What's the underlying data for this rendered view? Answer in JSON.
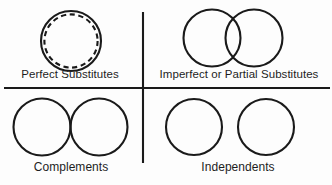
{
  "figure": {
    "type": "quadrant-venn-diagram",
    "background_color": "#fdfdfd",
    "stroke_color": "#1a1a1a",
    "text_color": "#1d1d1d"
  },
  "dividers": {
    "vertical": {
      "x": 143,
      "y_start": 12,
      "y_end": 163
    },
    "horizontal": {
      "y": 88,
      "x_start": 4,
      "x_end": 330
    }
  },
  "quadrants": [
    {
      "id": "perfect-substitutes",
      "position": "top-left",
      "label": "Perfect Substitutes",
      "relation": "coincident",
      "shapes": [
        {
          "kind": "circle",
          "style": "solid",
          "cx": 71,
          "cy": 41,
          "r": 30
        },
        {
          "kind": "circle",
          "style": "dashed",
          "cx": 71,
          "cy": 41,
          "r": 27
        }
      ]
    },
    {
      "id": "imperfect-or-partial-substitutes",
      "position": "top-right",
      "label": "Imperfect or Partial Substitutes",
      "relation": "overlapping",
      "shapes": [
        {
          "kind": "circle",
          "style": "solid",
          "cx": 212,
          "cy": 38,
          "r": 29
        },
        {
          "kind": "circle",
          "style": "solid",
          "cx": 254,
          "cy": 38,
          "r": 29
        }
      ]
    },
    {
      "id": "complements",
      "position": "bottom-left",
      "label": "Complements",
      "relation": "tangent",
      "shapes": [
        {
          "kind": "circle",
          "style": "solid",
          "cx": 41,
          "cy": 127,
          "r": 29
        },
        {
          "kind": "circle",
          "style": "solid",
          "cx": 99,
          "cy": 127,
          "r": 29
        }
      ]
    },
    {
      "id": "independents",
      "position": "bottom-right",
      "label": "Independents",
      "relation": "disjoint",
      "shapes": [
        {
          "kind": "circle",
          "style": "solid",
          "cx": 194,
          "cy": 127,
          "r": 28
        },
        {
          "kind": "circle",
          "style": "solid",
          "cx": 266,
          "cy": 127,
          "r": 28
        }
      ]
    }
  ]
}
